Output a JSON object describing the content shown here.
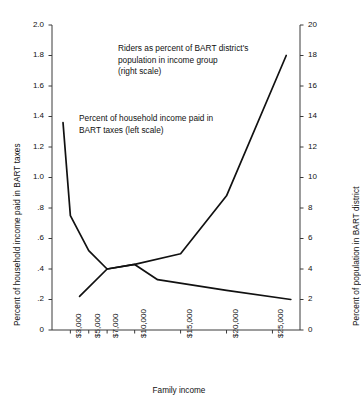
{
  "chart_data": {
    "type": "line",
    "title": "",
    "xlabel": "Family income",
    "ylabel_left": "Percent of household income paid in BART taxes",
    "ylabel_right": "Percent of population in BART district",
    "grid": false,
    "legend_position": "inline-annotation",
    "xtick_labels": [
      "$3,000",
      "$5,000",
      "$7,000",
      "$10,000",
      "$15,000",
      "$20,000",
      "$25,000"
    ],
    "xtick_positions": [
      3000,
      5000,
      7000,
      10000,
      15000,
      20000,
      25000
    ],
    "ylim_left": [
      0,
      2.0
    ],
    "ytick_labels_left": [
      "2.0",
      "1.8",
      "1.6",
      "1.4",
      "1.2",
      "1.0",
      ".8",
      ".6",
      ".4",
      ".2",
      "0"
    ],
    "ytick_values_left": [
      2.0,
      1.8,
      1.6,
      1.4,
      1.2,
      1.0,
      0.8,
      0.6,
      0.4,
      0.2,
      0
    ],
    "ylim_right": [
      0,
      20
    ],
    "ytick_labels_right": [
      "20",
      "18",
      "16",
      "14",
      "12",
      "10",
      "8",
      "6",
      "4",
      "2",
      "0"
    ],
    "ytick_values_right": [
      20,
      18,
      16,
      14,
      12,
      10,
      8,
      6,
      4,
      2,
      0
    ],
    "series": [
      {
        "name": "Percent of household income paid in BART taxes",
        "axis": "left",
        "annotation": "Percent of household income paid in\nBART taxes (left scale)",
        "x": [
          2200,
          3000,
          5000,
          7000,
          10000,
          12500,
          20000,
          27000
        ],
        "values": [
          1.36,
          0.75,
          0.52,
          0.4,
          0.43,
          0.33,
          0.26,
          0.2
        ]
      },
      {
        "name": "Riders as percent of BART district's population in income group",
        "axis": "right",
        "annotation": "Riders as percent of BART district's\npopulation in income group\n(right scale)",
        "x": [
          4000,
          7000,
          10000,
          15000,
          20000,
          26500
        ],
        "values": [
          2.2,
          4.0,
          4.3,
          5.0,
          8.8,
          18.0
        ]
      }
    ],
    "line_color": "#111111",
    "axis_color": "#3a3a3a",
    "background": "#ffffff"
  }
}
